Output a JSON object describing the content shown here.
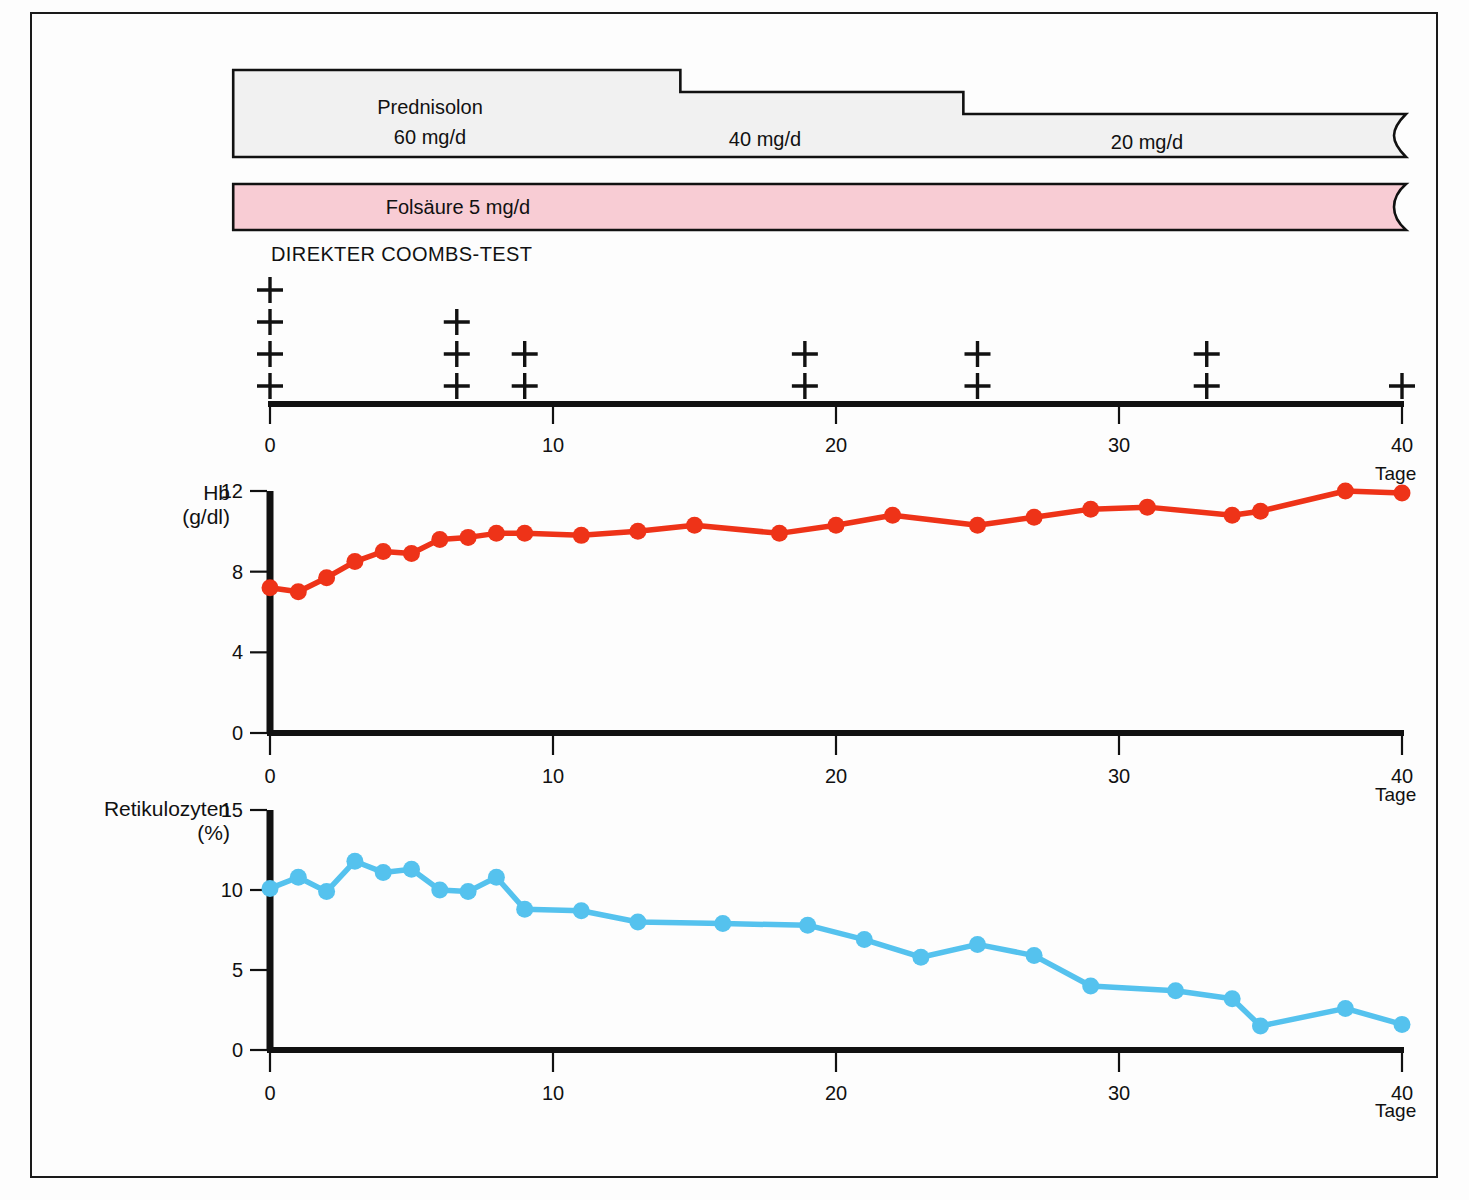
{
  "figure": {
    "background": "#fdfdfd",
    "frame_color": "#1a1a1a"
  },
  "therapy_bars": [
    {
      "name": "prednisolon",
      "drug": "Prednisolon",
      "fill": "#f1f1f1",
      "doses": [
        {
          "label": "60 mg/d",
          "start_day": -1.3,
          "end_day": 14.5,
          "level": 0
        },
        {
          "label": "40 mg/d",
          "start_day": 14.5,
          "end_day": 24.5,
          "level": 1
        },
        {
          "label": "20 mg/d",
          "start_day": 24.5,
          "end_day": 45.0,
          "level": 2
        }
      ]
    },
    {
      "name": "folsaeure",
      "drug": "Folsäure",
      "label": "Folsäure 5 mg/d",
      "fill": "#f8ccd4",
      "start_day": -1.3,
      "end_day": 45.0
    }
  ],
  "coombs": {
    "title": "DIREKTER COOMBS-TEST",
    "symbol": "+",
    "readings": [
      {
        "day": 0.0,
        "crosses": 4
      },
      {
        "day": 6.6,
        "crosses": 3
      },
      {
        "day": 9.0,
        "crosses": 2
      },
      {
        "day": 18.9,
        "crosses": 2
      },
      {
        "day": 25.0,
        "crosses": 2
      },
      {
        "day": 33.1,
        "crosses": 2
      },
      {
        "day": 40.0,
        "crosses": 1
      }
    ],
    "axis": {
      "label": "Tage",
      "ticks": [
        0,
        10,
        20,
        30,
        40
      ],
      "min": 0,
      "max": 40
    }
  },
  "chart_data": [
    {
      "type": "line",
      "name": "haemoglobin",
      "title": "",
      "ylabel": "Hb",
      "yunit": "(g/dl)",
      "xlabel": "Tage",
      "color": "#ee3318",
      "marker": "circle",
      "ylim": [
        0,
        12
      ],
      "yticks": [
        0,
        4,
        8,
        12
      ],
      "xlim": [
        0,
        40
      ],
      "xticks": [
        0,
        10,
        20,
        30,
        40
      ],
      "grid": false,
      "x": [
        0,
        1,
        2,
        3,
        4,
        5,
        6,
        7,
        8,
        9,
        11,
        13,
        15,
        18,
        20,
        22,
        25,
        27,
        29,
        31,
        34,
        35,
        38,
        40
      ],
      "y": [
        7.2,
        7.0,
        7.7,
        8.5,
        9.0,
        8.9,
        9.6,
        9.7,
        9.9,
        9.9,
        9.8,
        10.0,
        10.3,
        9.9,
        10.3,
        10.8,
        10.3,
        10.7,
        11.1,
        11.2,
        10.8,
        11.0,
        12.0,
        11.9
      ]
    },
    {
      "type": "line",
      "name": "retikulozyten",
      "title": "",
      "ylabel": "Retikulozyten",
      "yunit": "(%)",
      "xlabel": "Tage",
      "color": "#55c2ee",
      "marker": "circle",
      "ylim": [
        0,
        15
      ],
      "yticks": [
        0,
        5,
        10,
        15
      ],
      "xlim": [
        0,
        40
      ],
      "xticks": [
        0,
        10,
        20,
        30,
        40
      ],
      "grid": false,
      "x": [
        0,
        1,
        2,
        3,
        4,
        5,
        6,
        7,
        8,
        9,
        11,
        13,
        16,
        19,
        21,
        23,
        25,
        27,
        29,
        32,
        34,
        35,
        38,
        40
      ],
      "y": [
        10.1,
        10.8,
        9.9,
        11.8,
        11.1,
        11.3,
        10.0,
        9.9,
        10.8,
        8.8,
        8.7,
        8.0,
        7.9,
        7.8,
        6.9,
        5.8,
        6.6,
        5.9,
        4.0,
        3.7,
        3.2,
        1.5,
        2.6,
        1.6
      ]
    }
  ]
}
